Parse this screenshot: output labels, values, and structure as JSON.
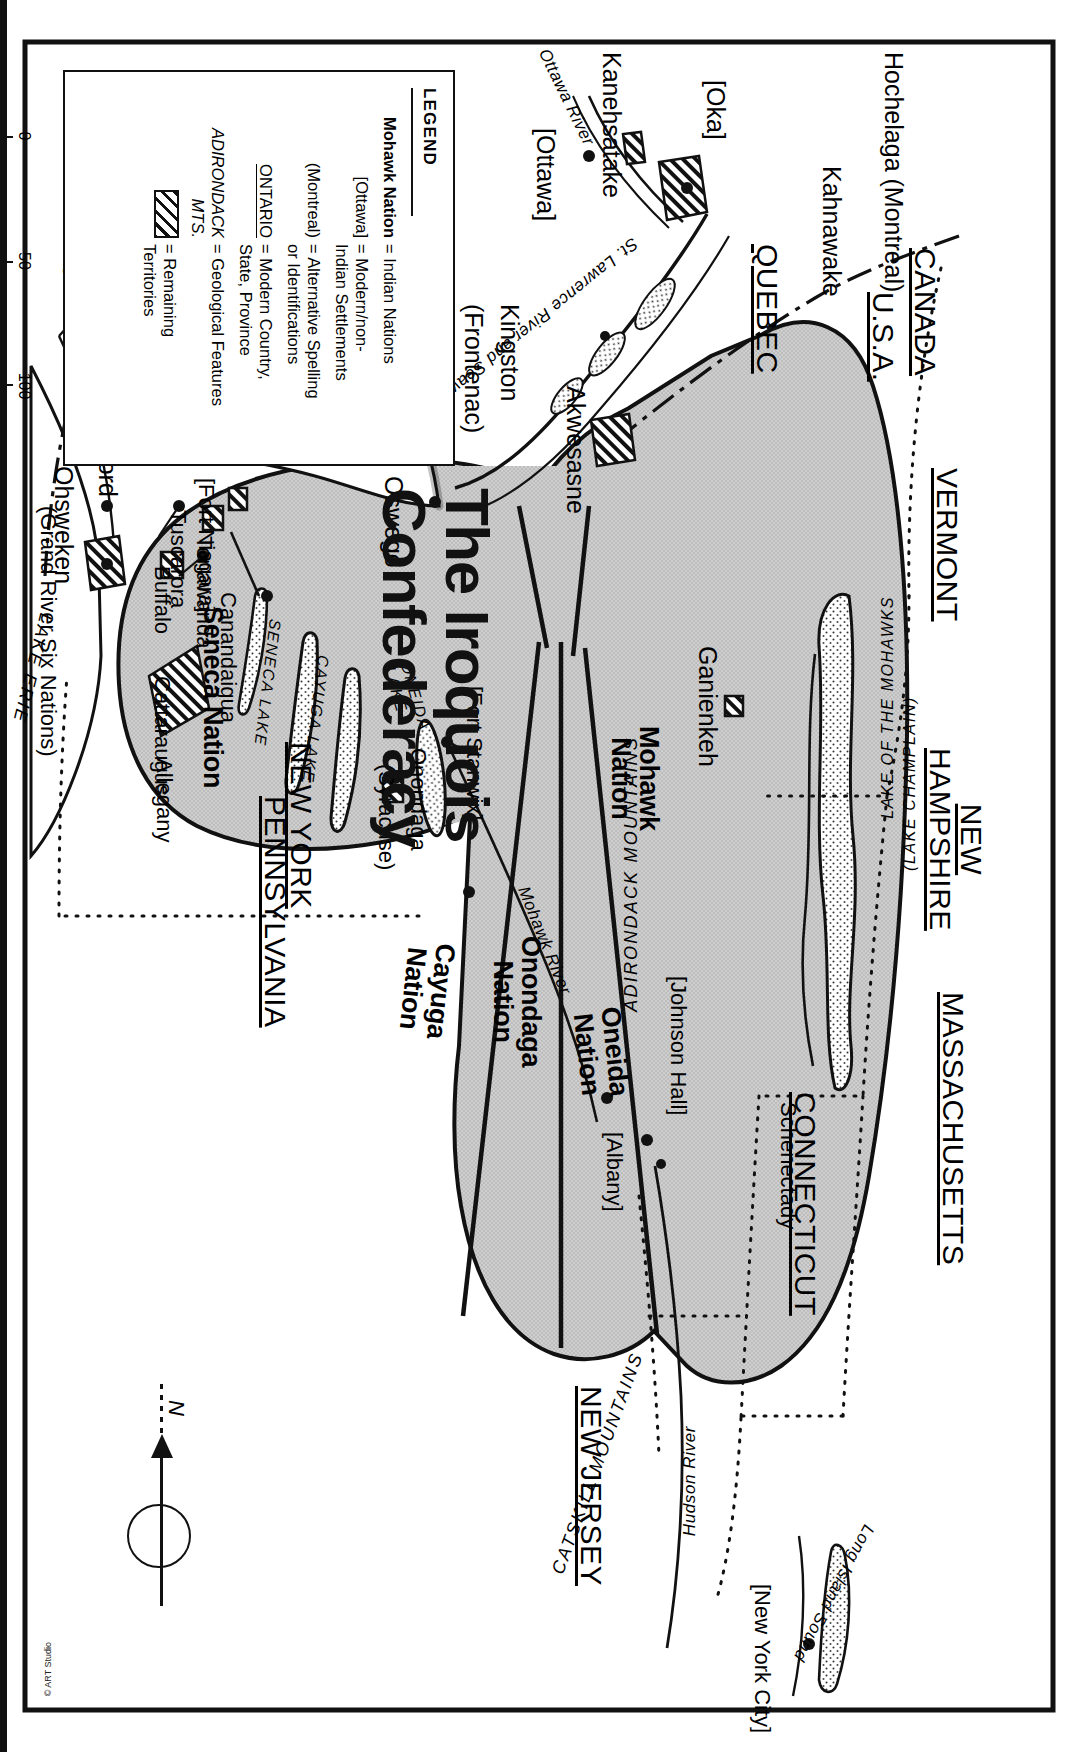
{
  "document": {
    "title_line1": "The Iroquois",
    "title_line2": "Confederacy",
    "credit": "© ART Studio",
    "orientation_note": "map printed sideways (rotated 90°)"
  },
  "legend": {
    "heading": "LEGEND",
    "rows": [
      {
        "key": "Mohawk Nation",
        "key_style": "bold",
        "value": "= Indian Nations"
      },
      {
        "key": "[Ottawa]",
        "key_style": "plain",
        "value": "= Modern/non-\nIndian Settlements"
      },
      {
        "key": "(Montreal)",
        "key_style": "plain",
        "value": "= Alternative Spelling\nor Identifications"
      },
      {
        "key": "ONTARIO",
        "key_style": "underline",
        "value": "= Modern Country,\nState, Province"
      },
      {
        "key": "ADIRONDACK MTS.",
        "key_style": "italic",
        "value": "= Geological Features"
      },
      {
        "key": "hatch-swatch",
        "key_style": "swatch",
        "value": "= Remaining\nTerritories"
      }
    ]
  },
  "scale": {
    "ticks": [
      "0",
      "50",
      "100"
    ],
    "unit": "MILES"
  },
  "compass": {
    "north_label": "N"
  },
  "nations": [
    {
      "name": "Mohawk\nNation"
    },
    {
      "name": "Oneida\nNation"
    },
    {
      "name": "Onondaga\nNation"
    },
    {
      "name": "Cayuga\nNation"
    },
    {
      "name": "Seneca Nation"
    }
  ],
  "countries_states": [
    {
      "label": "CANADA"
    },
    {
      "label": "U.S.A."
    },
    {
      "label": "QUEBEC"
    },
    {
      "label": "ONTARIO"
    },
    {
      "label": "VERMONT"
    },
    {
      "label": "NEW\nHAMPSHIRE"
    },
    {
      "label": "MASSACHUSETTS"
    },
    {
      "label": "CONNECTICUT"
    },
    {
      "label": "NEW JERSEY"
    },
    {
      "label": "NEW YORK"
    },
    {
      "label": "PENNSYLVANIA"
    }
  ],
  "settlements": [
    {
      "label": "Hochelaga (Montreal)"
    },
    {
      "label": "Kahnawake"
    },
    {
      "label": "[Oka]"
    },
    {
      "label": "Kanehsatake"
    },
    {
      "label": "[Ottawa]"
    },
    {
      "label": "Akwesasne"
    },
    {
      "label": "Ganienkeh"
    },
    {
      "label": "[Johnson Hall]"
    },
    {
      "label": "Schenectady"
    },
    {
      "label": "[Albany]"
    },
    {
      "label": "[Fort Stanwix]"
    },
    {
      "label": "Onondaga\n(Syracuse)"
    },
    {
      "label": "Oswego"
    },
    {
      "label": "Kingston\n(Frontenac)"
    },
    {
      "label": "[Toronto]"
    },
    {
      "label": "Brantford"
    },
    {
      "label": "Ohsweken\n(Grand River Six Nations)"
    },
    {
      "label": "[Fort Niagara]"
    },
    {
      "label": "Tuscarora"
    },
    {
      "label": "Tonawanda"
    },
    {
      "label": "Buffalo"
    },
    {
      "label": "Canandaigua"
    },
    {
      "label": "Cattaraugus"
    },
    {
      "label": "Allegany"
    },
    {
      "label": "[New York City]"
    }
  ],
  "geographic_features": [
    {
      "label": "LAKE OF THE MOHAWKS\n(LAKE CHAMPLAIN)"
    },
    {
      "label": "ADIRONDACK MOUNTAINS"
    },
    {
      "label": "CATSKILL MOUNTAINS"
    },
    {
      "label": "ONEIDA LAKE"
    },
    {
      "label": "CAYUGA LAKE"
    },
    {
      "label": "SENECA LAKE"
    },
    {
      "label": "LAKE ONTARIO"
    },
    {
      "label": "LAKE ERIE"
    },
    {
      "label": "BAY OF QUINTE"
    },
    {
      "label": "Long Island Sound"
    },
    {
      "label": "Ottawa River"
    },
    {
      "label": "St. Lawrence River and Seaway"
    },
    {
      "label": "Mohawk River"
    },
    {
      "label": "Hudson River"
    },
    {
      "label": "Grand R."
    }
  ],
  "labels": {
    "hochelaga": "Hochelaga (Montreal)",
    "kahnawake": "Kahnawake",
    "canada": "CANADA",
    "usa": "U.S.A.",
    "vermont": "VERMONT",
    "new_hampshire": "NEW\nHAMPSHIRE",
    "massachusetts": "MASSACHUSETTS",
    "connecticut": "CONNECTICUT",
    "new_jersey": "NEW JERSEY",
    "quebec": "QUEBEC",
    "ontario": "ONTARIO",
    "new_york": "NEW YORK",
    "pennsylvania": "PENNSYLVANIA",
    "oka": "[Oka]",
    "kanehsatake": "Kanehsatake",
    "ottawa_city": "[Ottawa]",
    "ottawa_river": "Ottawa River",
    "st_lawrence": "St. Lawrence River and Seaway",
    "akwesasne": "Akwesasne",
    "ganienkeh": "Ganienkeh",
    "lake_mohawks": "LAKE OF THE MOHAWKS",
    "lake_champlain": "(LAKE CHAMPLAIN)",
    "adirondacks": "ADIRONDACK MOUNTAINS",
    "catskills": "CATSKILL MOUNTAINS",
    "mohawk_nation": "Mohawk\nNation",
    "oneida_nation": "Oneida\nNation",
    "onondaga_nation": "Onondaga\nNation",
    "cayuga_nation": "Cayuga\nNation",
    "seneca_nation": "Seneca Nation",
    "fort_stanwix": "[Fort Stanwix]",
    "johnson_hall": "[Johnson Hall]",
    "schenectady": "Schenectady",
    "albany": "[Albany]",
    "mohawk_river": "Mohawk River",
    "hudson_river": "Hudson River",
    "onondaga_syracuse_1": "Onondaga",
    "onondaga_syracuse_2": "(Syracuse)",
    "oneida_lake": "ONEIDA\nLAKE",
    "cayuga_lake": "CAYUGA LAKE",
    "seneca_lake": "SENECA LAKE",
    "oswego": "Oswego",
    "lake_ontario": "LAKE ONTARIO",
    "bay_of_quinte": "BAY OF QUINTE",
    "kingston": "Kingston",
    "frontenac": "(Frontenac)",
    "toronto": "[Toronto]",
    "brantford": "Brantford",
    "grand_r": "Grand R.",
    "ohsweken": "Ohsweken",
    "grand_river_six_nations": "(Grand River Six Nations)",
    "lake_erie": "LAKE ERIE",
    "fort_niagara": "[Fort Niagara]",
    "tuscarora": "Tuscarora",
    "tonawanda": "Tonawanda",
    "buffalo": "Buffalo",
    "canandaigua": "Canandaigua",
    "cattaraugus": "Cattaraugus",
    "allegany": "Allegany",
    "long_island_sound": "Long Island Sound",
    "new_york_city": "[New York City]"
  },
  "colors": {
    "ink": "#111111",
    "territory_fill": "#c9c9c9",
    "paper": "#ffffff"
  }
}
